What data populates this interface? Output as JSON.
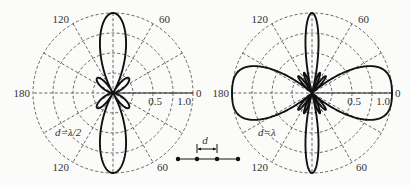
{
  "chart_data": [
    {
      "type": "polar-line",
      "name": "array-pattern-half-wavelength",
      "title": "",
      "annotation": "d=λ/2",
      "elements": 4,
      "spacing_wavelengths": 0.5,
      "radial_ticks": [
        "0.5",
        "1.0"
      ],
      "radial_range": [
        0,
        1.0
      ],
      "angle_labels": {
        "right": "0",
        "left": "180",
        "upper_right": "60",
        "upper_left": "120",
        "lower_right": "60",
        "lower_left": "120"
      },
      "grid": "dashed",
      "description": "Broadside pattern: main lobes at 90° and 270°, small side lobes near ±45°"
    },
    {
      "type": "polar-line",
      "name": "array-pattern-one-wavelength",
      "title": "",
      "annotation": "d=λ",
      "elements": 4,
      "spacing_wavelengths": 1.0,
      "radial_ticks": [
        "0.5",
        "1.0"
      ],
      "radial_range": [
        0,
        1.0
      ],
      "angle_labels": {
        "right": "0",
        "left": "180",
        "upper_right": "60",
        "upper_left": "120",
        "lower_right": "60",
        "lower_left": "120"
      },
      "grid": "dashed",
      "description": "Grating lobes at 0° and 180° plus main lobes at 90° and 270°, with many small side lobes"
    }
  ],
  "array_diagram": {
    "spacing_label": "d",
    "element_count": 4
  }
}
